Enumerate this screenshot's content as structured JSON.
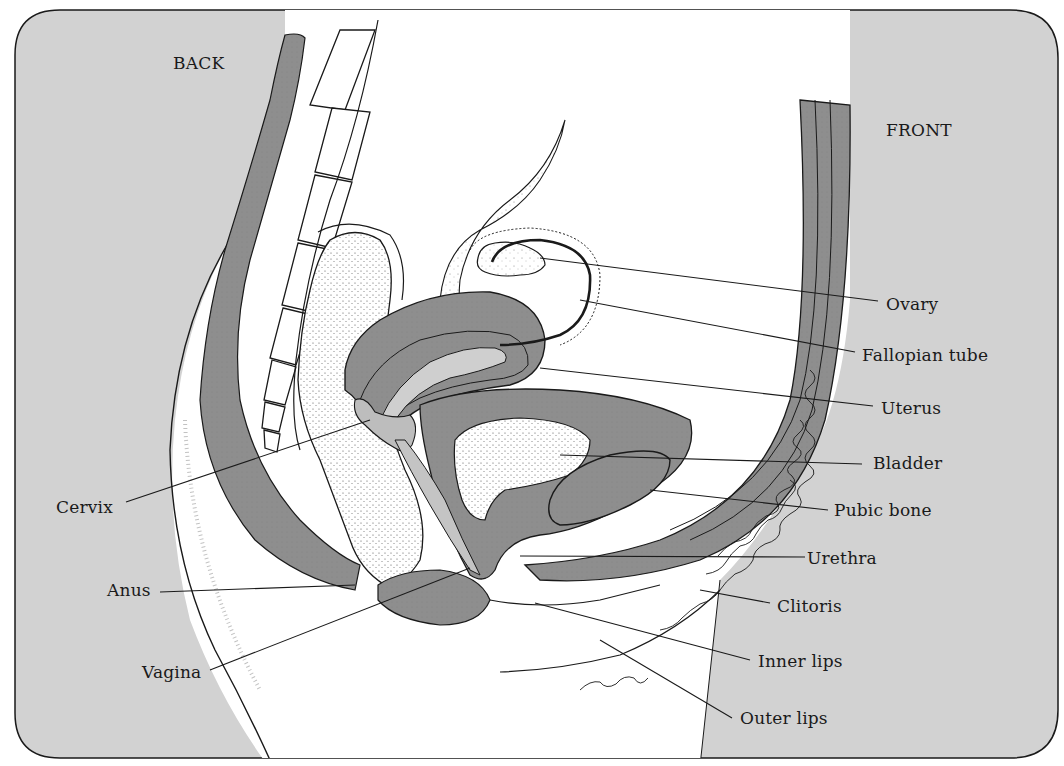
{
  "diagram": {
    "orientation": {
      "back_label": "BACK",
      "front_label": "FRONT"
    },
    "colors": {
      "background_panel": "#d2d2d2",
      "tissue_dark": "#8e8e8e",
      "tissue_light": "#ffffff",
      "outline": "#1a1a1a",
      "label_text": "#1a1a1a"
    },
    "labels_right": [
      {
        "id": "ovary",
        "text": "Ovary"
      },
      {
        "id": "fallopian-tube",
        "text": "Fallopian tube"
      },
      {
        "id": "uterus",
        "text": "Uterus"
      },
      {
        "id": "bladder",
        "text": "Bladder"
      },
      {
        "id": "pubic-bone",
        "text": "Pubic bone"
      },
      {
        "id": "urethra",
        "text": "Urethra"
      },
      {
        "id": "clitoris",
        "text": "Clitoris"
      },
      {
        "id": "inner-lips",
        "text": "Inner lips"
      },
      {
        "id": "outer-lips",
        "text": "Outer lips"
      }
    ],
    "labels_left": [
      {
        "id": "cervix",
        "text": "Cervix"
      },
      {
        "id": "anus",
        "text": "Anus"
      },
      {
        "id": "vagina",
        "text": "Vagina"
      }
    ]
  }
}
